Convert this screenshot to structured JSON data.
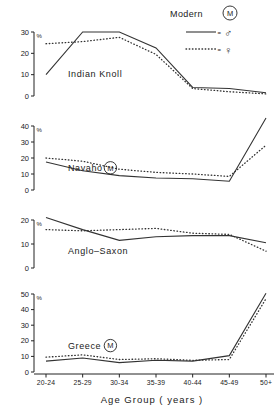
{
  "legend": {
    "title": "Modern",
    "modern_badge": "M",
    "male_symbol": "♂",
    "female_symbol": "♀",
    "male_line_style": "solid",
    "female_line_style": "dotted",
    "eq_male": "=",
    "eq_female": "="
  },
  "axis": {
    "x_title": "Age  Group ( years )",
    "y_unit": "%",
    "categories": [
      "20-24",
      "25-29",
      "30-34",
      "35-39",
      "40-44",
      "45-49",
      "50+"
    ]
  },
  "colors": {
    "ink": "#222222",
    "line": "#333333",
    "background": "#ffffff"
  },
  "chart_data": [
    {
      "type": "line",
      "title": "Indian  Knoll",
      "badge": "",
      "xlabel": "Age  Group ( years )",
      "ylabel": "%",
      "x": [
        "20-24",
        "25-29",
        "30-34",
        "35-39",
        "40-44",
        "45-49",
        "50+"
      ],
      "ylim": [
        0,
        30
      ],
      "yticks": [
        0,
        10,
        20,
        30
      ],
      "grid": false,
      "series": [
        {
          "name": "♂",
          "style": "solid",
          "values": [
            10.0,
            30.0,
            30.0,
            22.5,
            4.0,
            3.5,
            1.5
          ]
        },
        {
          "name": "♀",
          "style": "dotted",
          "values": [
            24.5,
            25.5,
            27.5,
            19.5,
            3.5,
            2.0,
            1.0
          ]
        }
      ]
    },
    {
      "type": "line",
      "title": "Navaho",
      "badge": "M",
      "xlabel": "Age  Group ( years )",
      "ylabel": "%",
      "x": [
        "20-24",
        "25-29",
        "30-34",
        "35-39",
        "40-44",
        "45-49",
        "50+"
      ],
      "ylim": [
        0,
        40
      ],
      "yticks": [
        0,
        10,
        20,
        30,
        40
      ],
      "grid": false,
      "series": [
        {
          "name": "♂",
          "style": "solid",
          "values": [
            17.5,
            12.0,
            9.0,
            7.5,
            7.0,
            5.5,
            45.0
          ]
        },
        {
          "name": "♀",
          "style": "dotted",
          "values": [
            20.0,
            18.0,
            13.0,
            11.0,
            10.0,
            8.5,
            28.0
          ]
        }
      ]
    },
    {
      "type": "line",
      "title": "Anglo–Saxon",
      "badge": "",
      "xlabel": "Age  Group ( years )",
      "ylabel": "%",
      "x": [
        "20-24",
        "25-29",
        "30-34",
        "35-39",
        "40-44",
        "45-49",
        "50+"
      ],
      "ylim": [
        0,
        20
      ],
      "yticks": [
        0,
        10,
        20
      ],
      "grid": false,
      "series": [
        {
          "name": "♂",
          "style": "solid",
          "values": [
            21.0,
            16.0,
            11.5,
            13.0,
            13.5,
            13.5,
            10.5
          ]
        },
        {
          "name": "♀",
          "style": "dotted",
          "values": [
            16.0,
            15.5,
            16.0,
            16.5,
            14.5,
            14.0,
            7.0
          ]
        }
      ]
    },
    {
      "type": "line",
      "title": "Greece",
      "badge": "M",
      "xlabel": "Age  Group ( years )",
      "ylabel": "%",
      "x": [
        "20-24",
        "25-29",
        "30-34",
        "35-39",
        "40-44",
        "45-49",
        "50+"
      ],
      "ylim": [
        0,
        50
      ],
      "yticks": [
        0,
        10,
        20,
        30,
        40,
        50
      ],
      "grid": false,
      "series": [
        {
          "name": "♂",
          "style": "solid",
          "values": [
            7.0,
            9.0,
            6.0,
            7.5,
            7.0,
            10.5,
            50.5
          ]
        },
        {
          "name": "♀",
          "style": "dotted",
          "values": [
            9.5,
            11.0,
            8.0,
            8.5,
            7.5,
            8.0,
            47.0
          ]
        }
      ]
    }
  ]
}
